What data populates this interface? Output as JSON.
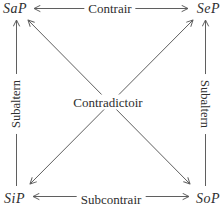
{
  "colors": {
    "background": "#ffffff",
    "text": "#2e2e2e",
    "line": "#5f5f5f"
  },
  "diagram": {
    "corners": {
      "top_left": "SaP",
      "top_right": "SeP",
      "bottom_left": "SiP",
      "bottom_right": "SoP"
    },
    "edges": {
      "top": "Contrair",
      "bottom": "Subcontrair",
      "left": "Subaltern",
      "right": "Subaltern",
      "center": "Contradictoir"
    }
  }
}
